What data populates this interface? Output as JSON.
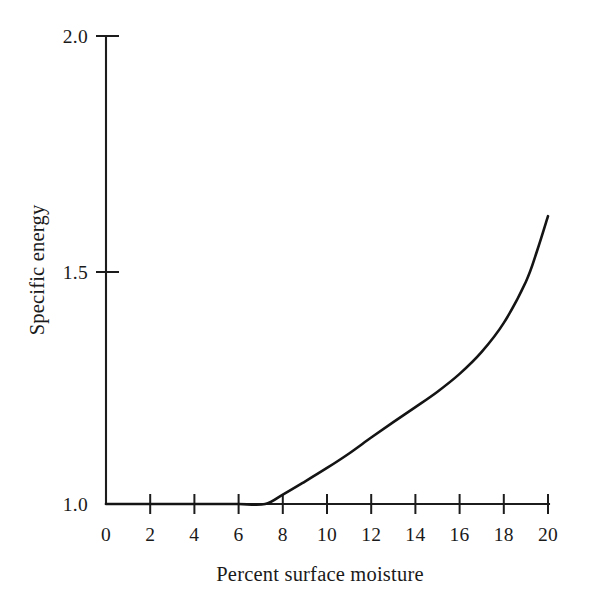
{
  "chart_data": {
    "type": "line",
    "title": "",
    "subtitle": "",
    "xlabel": "Percent surface moisture",
    "ylabel": "Specific energy",
    "xlim": [
      0,
      20
    ],
    "ylim": [
      1.0,
      2.0
    ],
    "grid": false,
    "legend": null,
    "legend_position": "none",
    "x_ticks": [
      0,
      2,
      4,
      6,
      8,
      10,
      12,
      14,
      16,
      18,
      20
    ],
    "x_tick_labels": [
      "0",
      "2",
      "4",
      "6",
      "8",
      "10",
      "12",
      "14",
      "16",
      "18",
      "20"
    ],
    "y_ticks": [
      1.0,
      1.5,
      2.0
    ],
    "y_tick_labels": [
      "1.0",
      "1.5",
      "2.0"
    ],
    "series": [
      {
        "name": "Specific energy vs percent surface moisture",
        "x": [
          0,
          1,
          2,
          3,
          4,
          5,
          6,
          7.2,
          8,
          9,
          10,
          11,
          12,
          13,
          14,
          15,
          16,
          17,
          18,
          19,
          19.5,
          20
        ],
        "y": [
          1.0,
          1.0,
          1.0,
          1.0,
          1.0,
          1.0,
          1.0,
          1.0,
          1.02,
          1.048,
          1.077,
          1.108,
          1.142,
          1.175,
          1.207,
          1.24,
          1.278,
          1.325,
          1.387,
          1.475,
          1.54,
          1.615
        ]
      }
    ],
    "annotations": []
  },
  "axes": {
    "y_axis_title": "Specific energy",
    "x_axis_title": "Percent surface moisture"
  },
  "style": {
    "line_color": "#141414",
    "axis_color": "#1c1c1c",
    "background": "#ffffff",
    "text_color": "#1a1a1a"
  }
}
